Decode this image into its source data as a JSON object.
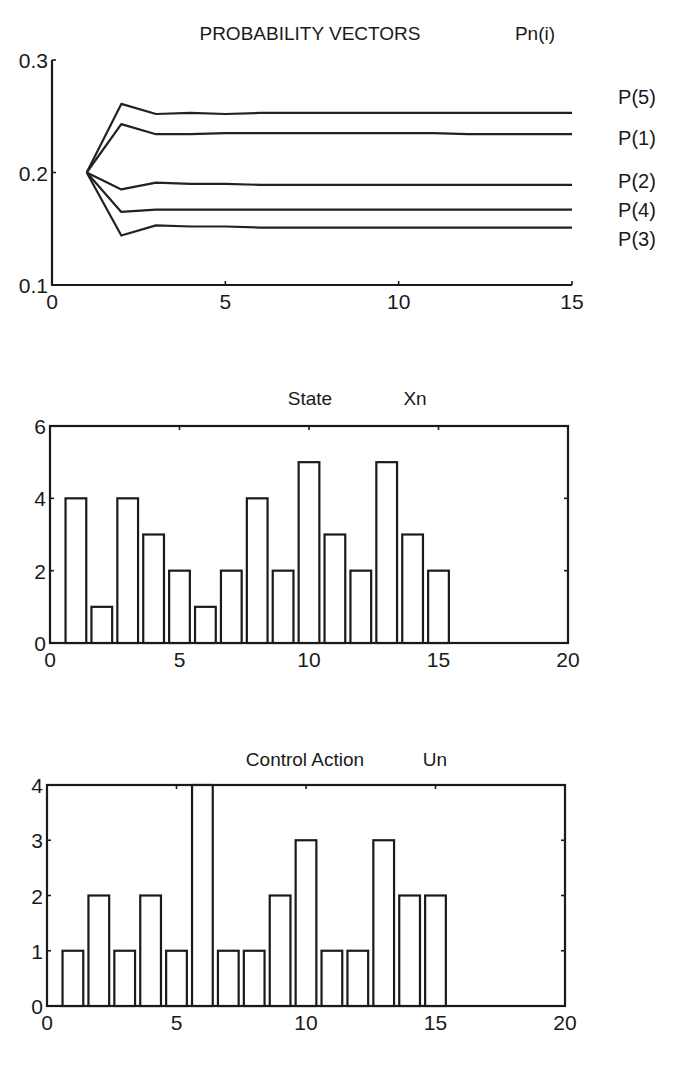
{
  "chart_data": [
    {
      "type": "line",
      "title": "PROBABILITY VECTORS",
      "title_suffix": "Pn(i)",
      "xlabel": "",
      "ylabel": "",
      "xlim": [
        0,
        15
      ],
      "ylim": [
        0.1,
        0.3
      ],
      "xticks": [
        "0",
        "5",
        "10",
        "15"
      ],
      "yticks": [
        "0.1",
        "0.2",
        "0.3"
      ],
      "grid": false,
      "legend_position": "right (labels at line ends)",
      "x": [
        1,
        2,
        3,
        4,
        5,
        6,
        7,
        8,
        9,
        10,
        11,
        12,
        13,
        14,
        15
      ],
      "series": [
        {
          "name": "P(5)",
          "values": [
            0.2,
            0.261,
            0.252,
            0.253,
            0.252,
            0.253,
            0.253,
            0.253,
            0.253,
            0.253,
            0.253,
            0.253,
            0.253,
            0.253,
            0.253
          ]
        },
        {
          "name": "P(1)",
          "values": [
            0.2,
            0.243,
            0.234,
            0.234,
            0.235,
            0.235,
            0.235,
            0.235,
            0.235,
            0.235,
            0.235,
            0.234,
            0.234,
            0.234,
            0.234
          ]
        },
        {
          "name": "P(2)",
          "values": [
            0.2,
            0.185,
            0.191,
            0.19,
            0.19,
            0.189,
            0.189,
            0.189,
            0.189,
            0.189,
            0.189,
            0.189,
            0.189,
            0.189,
            0.189
          ]
        },
        {
          "name": "P(4)",
          "values": [
            0.2,
            0.165,
            0.167,
            0.167,
            0.167,
            0.167,
            0.167,
            0.167,
            0.167,
            0.167,
            0.167,
            0.167,
            0.167,
            0.167,
            0.167
          ]
        },
        {
          "name": "P(3)",
          "values": [
            0.2,
            0.144,
            0.153,
            0.152,
            0.152,
            0.151,
            0.151,
            0.151,
            0.151,
            0.151,
            0.151,
            0.151,
            0.151,
            0.151,
            0.151
          ]
        }
      ]
    },
    {
      "type": "bar",
      "title": "State",
      "title_suffix": "Xn",
      "xlabel": "",
      "ylabel": "",
      "xlim": [
        0,
        20
      ],
      "ylim": [
        0,
        6
      ],
      "xticks": [
        "0",
        "5",
        "10",
        "15",
        "20"
      ],
      "yticks": [
        "0",
        "2",
        "4",
        "6"
      ],
      "grid": false,
      "categories": [
        1,
        2,
        3,
        4,
        5,
        6,
        7,
        8,
        9,
        10,
        11,
        12,
        13,
        14,
        15
      ],
      "values": [
        4,
        1,
        4,
        3,
        2,
        1,
        2,
        4,
        2,
        5,
        3,
        2,
        5,
        3,
        2
      ]
    },
    {
      "type": "bar",
      "title": "Control Action",
      "title_suffix": "Un",
      "xlabel": "",
      "ylabel": "",
      "xlim": [
        0,
        20
      ],
      "ylim": [
        0,
        4
      ],
      "xticks": [
        "0",
        "5",
        "10",
        "15",
        "20"
      ],
      "yticks": [
        "0",
        "1",
        "2",
        "3",
        "4"
      ],
      "grid": false,
      "categories": [
        1,
        2,
        3,
        4,
        5,
        6,
        7,
        8,
        9,
        10,
        11,
        12,
        13,
        14,
        15
      ],
      "values": [
        1,
        2,
        1,
        2,
        1,
        4,
        1,
        1,
        2,
        3,
        1,
        1,
        3,
        2,
        2
      ]
    }
  ],
  "colors": {
    "ink": "#1a1a1a",
    "background": "#ffffff"
  }
}
